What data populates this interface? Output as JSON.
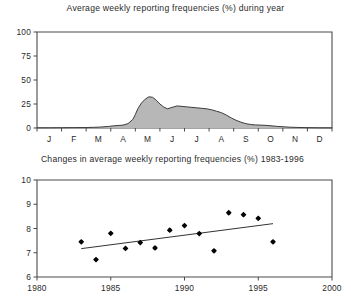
{
  "figure": {
    "width": 351,
    "height": 303,
    "background": "#ffffff"
  },
  "chart_data": [
    {
      "type": "area",
      "title": "Average weekly reporting frequencies (%) during year",
      "xlabel": "",
      "ylabel": "",
      "ylim": [
        0,
        100
      ],
      "yticks": [
        0,
        25,
        50,
        75,
        100
      ],
      "ytick_labels": [
        "0",
        "25",
        "50",
        "75",
        "100"
      ],
      "categories": [
        "J",
        "F",
        "M",
        "A",
        "M",
        "J",
        "J",
        "A",
        "S",
        "O",
        "N",
        "D"
      ],
      "xtick_labels": [
        "J",
        "F",
        "M",
        "A",
        "M",
        "J",
        "J",
        "A",
        "S",
        "O",
        "N",
        "D"
      ],
      "grid": false,
      "legend": "none",
      "fill_color": "#b7b7b7",
      "line_color": "#3c3c3c",
      "x": [
        0.0,
        0.5,
        1.0,
        1.5,
        2.0,
        2.3,
        2.6,
        2.9,
        3.1,
        3.3,
        3.5,
        3.7,
        3.9,
        4.0,
        4.1,
        4.25,
        4.4,
        4.55,
        4.7,
        4.85,
        5.0,
        5.15,
        5.3,
        5.5,
        5.7,
        5.9,
        6.1,
        6.3,
        6.5,
        6.7,
        6.9,
        7.1,
        7.3,
        7.5,
        7.7,
        7.9,
        8.1,
        8.3,
        8.5,
        8.7,
        8.9,
        9.1,
        9.4,
        9.8,
        10.3,
        10.9,
        11.5,
        12.0
      ],
      "values": [
        0.2,
        0.2,
        0.3,
        0.4,
        0.5,
        0.7,
        1.0,
        1.6,
        2.2,
        2.6,
        3.0,
        4.5,
        9.0,
        14.0,
        20.0,
        26.0,
        30.0,
        32.5,
        32.0,
        29.0,
        25.0,
        22.0,
        20.0,
        21.5,
        23.0,
        22.5,
        22.0,
        21.5,
        21.0,
        20.5,
        20.0,
        19.0,
        17.5,
        16.0,
        13.5,
        10.5,
        8.0,
        6.0,
        4.5,
        3.6,
        3.2,
        3.0,
        2.6,
        1.6,
        0.8,
        0.4,
        0.2,
        0.1
      ]
    },
    {
      "type": "scatter",
      "title": "Changes in average weekly reporting frequencies (%) 1983-1996",
      "xlabel": "",
      "ylabel": "",
      "xlim": [
        1980,
        2000
      ],
      "ylim": [
        6,
        10
      ],
      "xticks": [
        1980,
        1985,
        1990,
        1995,
        2000
      ],
      "xtick_labels": [
        "1980",
        "1985",
        "1990",
        "1995",
        "2000"
      ],
      "yticks": [
        6,
        7,
        8,
        9,
        10
      ],
      "ytick_labels": [
        "6",
        "7",
        "8",
        "9",
        "10"
      ],
      "grid": false,
      "legend": "none",
      "marker_color": "#050505",
      "x": [
        1983,
        1984,
        1985,
        1986,
        1987,
        1988,
        1989,
        1990,
        1991,
        1992,
        1993,
        1994,
        1995,
        1996
      ],
      "values": [
        7.45,
        6.72,
        7.8,
        7.18,
        7.42,
        7.2,
        7.93,
        8.12,
        7.79,
        7.08,
        8.65,
        8.57,
        8.42,
        7.45
      ],
      "trend": {
        "label": "linear trend",
        "x": [
          1983,
          1996
        ],
        "y": [
          7.17,
          8.2
        ],
        "color": "#333333"
      }
    }
  ]
}
